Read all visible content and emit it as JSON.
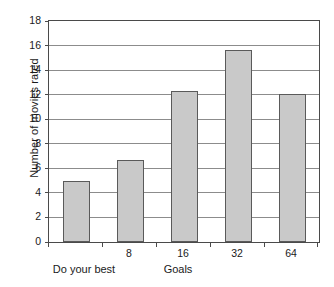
{
  "chart_data": {
    "type": "bar",
    "title": "",
    "subtitle": "",
    "categories": [
      "Do your best",
      "8",
      "16",
      "32",
      "64"
    ],
    "values": [
      5.0,
      6.7,
      12.3,
      15.65,
      12.05
    ],
    "xlabel": "Goals",
    "ylabel": "Number of movies rated",
    "ylim": [
      0,
      18
    ],
    "ytick_step": 2,
    "yticks": [
      0,
      2,
      4,
      6,
      8,
      10,
      12,
      14,
      16,
      18
    ],
    "ytick_labels": [
      "0",
      "2",
      "4",
      "6",
      "8",
      "10",
      "12",
      "14",
      "16",
      "18"
    ],
    "xtick_labels": [
      "",
      "8",
      "16",
      "32",
      "64"
    ],
    "baseline_category_label": "Do your best",
    "grid": "horizontal",
    "legend": "none",
    "annotations": [],
    "colors": {
      "bar_fill": "#c9c9c9",
      "bar_border": "#5a5a5a",
      "gridline": "#8c8c8c",
      "axis": "#4a4a4a",
      "text": "#1a1a1a",
      "background": "#ffffff"
    }
  }
}
